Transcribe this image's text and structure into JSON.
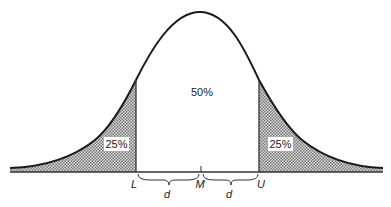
{
  "diagram": {
    "type": "normal-distribution-curve",
    "regions": {
      "left_tail": "25%",
      "center": "50%",
      "right_tail": "25%"
    },
    "axis_labels": {
      "lower": "L",
      "median": "M",
      "upper": "U"
    },
    "distance_labels": {
      "left": "d",
      "right": "d"
    },
    "colors": {
      "curve": "#1a1a1a",
      "shade": "#b8b8b8",
      "background": "#ffffff"
    }
  }
}
